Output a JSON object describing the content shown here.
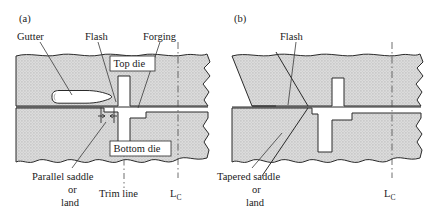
{
  "figure": {
    "background_color": "#ffffff",
    "die_fill_color": "#d6d6d6",
    "line_color": "#2a2a2a",
    "cavity_color": "#ffffff"
  },
  "panels": [
    {
      "id": "a",
      "id_label": "(a)",
      "saddle_type": "parallel",
      "labels": {
        "gutter": "Gutter",
        "flash": "Flash",
        "forging": "Forging",
        "top_die": "Top die",
        "bottom_die": "Bottom die",
        "saddle_line1": "Parallel saddle",
        "saddle_line2": "or",
        "saddle_line3": "land",
        "trim_line": "Trim line",
        "lc_symbol": "L",
        "lc_subscript": "C"
      }
    },
    {
      "id": "b",
      "id_label": "(b)",
      "saddle_type": "tapered",
      "labels": {
        "flash": "Flash",
        "saddle_line1": "Tapered saddle",
        "saddle_line2": "or",
        "saddle_line3": "land",
        "lc_symbol": "L",
        "lc_subscript": "C"
      }
    }
  ]
}
